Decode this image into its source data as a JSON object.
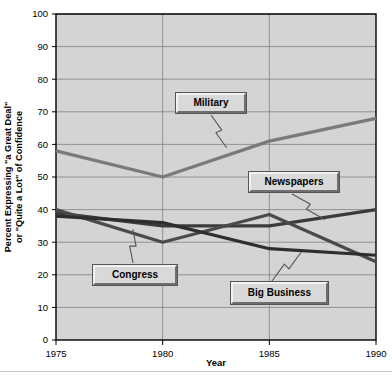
{
  "chart_data": {
    "type": "line",
    "title": "",
    "xlabel": "Year",
    "ylabel": "Percent Expressing \"a Great Deal\" or \"Quite a Lot\" of Confidence",
    "ylabel_line1": "Percent Expressing \"a Great Deal\"",
    "ylabel_line2": "or \"Quite a Lot\" of Confidence",
    "x": [
      1975,
      1980,
      1985,
      1990
    ],
    "categories": [
      "1975",
      "1980",
      "1985",
      "1990"
    ],
    "xtick_labels": [
      "1975",
      "1980",
      "1985",
      "1990"
    ],
    "ytick_labels": [
      "0",
      "10",
      "20",
      "30",
      "40",
      "50",
      "60",
      "70",
      "80",
      "90",
      "100"
    ],
    "ytick_values": [
      0,
      10,
      20,
      30,
      40,
      50,
      60,
      70,
      80,
      90,
      100
    ],
    "ylim": [
      0,
      100
    ],
    "xlim": [
      1975,
      1990
    ],
    "grid": "horizontal-and-vertical",
    "legend": "inline-callout-boxes",
    "series": [
      {
        "name": "Military",
        "label": "Military",
        "color": "#7a7a7a",
        "values": [
          58,
          50,
          61,
          68
        ]
      },
      {
        "name": "Newspapers",
        "label": "Newspapers",
        "color": "#3b3b3b",
        "values": [
          39,
          35,
          35,
          40
        ]
      },
      {
        "name": "Congress",
        "label": "Congress",
        "color": "#4a4a4a",
        "values": [
          40,
          30,
          38.5,
          24
        ]
      },
      {
        "name": "Big Business",
        "label": "Big Business",
        "color": "#2e2e2e",
        "values": [
          38,
          36,
          28,
          26
        ]
      }
    ],
    "annotations": [
      {
        "label": "Military",
        "target_series": "Military",
        "target_x": 1983,
        "target_y": 59
      },
      {
        "label": "Newspapers",
        "target_series": "Newspapers",
        "target_x": 1987.6,
        "target_y": 37
      },
      {
        "label": "Congress",
        "target_series": "Congress",
        "target_x": 1978.6,
        "target_y": 34
      },
      {
        "label": "Big Business",
        "target_series": "Big Business",
        "target_x": 1986.5,
        "target_y": 27
      }
    ],
    "style": {
      "plot_background": "#d4d4d4",
      "page_background": "#ffffff",
      "gridline_color": "#8a8a8a",
      "axis_color": "#000000",
      "callout_face": "#d9d9d9",
      "callout_highlight": "#f2f2f2",
      "callout_shadow": "#6e6e6e"
    }
  },
  "axes": {
    "x_title": "Year",
    "y_title_line1": "Percent Expressing \"a Great Deal\"",
    "y_title_line2": "or \"Quite a Lot\" of Confidence"
  },
  "labels": {
    "military": "Military",
    "newspapers": "Newspapers",
    "congress": "Congress",
    "big_business": "Big Business"
  }
}
